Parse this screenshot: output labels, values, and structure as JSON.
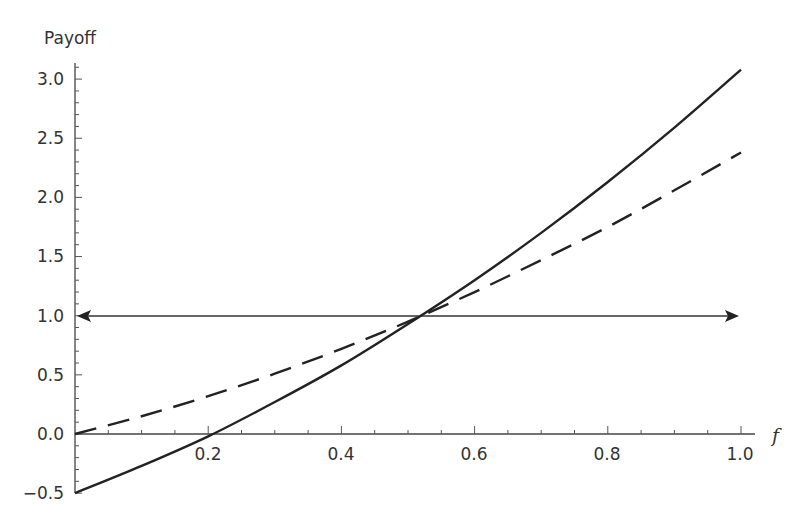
{
  "chart_data": {
    "type": "line",
    "title": "",
    "xlabel": "f",
    "ylabel": "Payoff",
    "xlim": [
      0,
      1.0
    ],
    "ylim": [
      -0.5,
      3.1
    ],
    "grid": false,
    "legend": null,
    "x_ticks": [
      "0.2",
      "0.4",
      "0.6",
      "0.8",
      "1.0"
    ],
    "y_ticks": [
      "-0.5",
      "0.0",
      "0.5",
      "1.0",
      "1.5",
      "2.0",
      "2.5",
      "3.0"
    ],
    "x": [
      0.0,
      0.1,
      0.2,
      0.3,
      0.4,
      0.5,
      0.6,
      0.7,
      0.8,
      0.9,
      1.0
    ],
    "series": [
      {
        "name": "solid",
        "style": "solid",
        "values": [
          -0.5,
          -0.27,
          -0.02,
          0.27,
          0.58,
          0.93,
          1.3,
          1.7,
          2.13,
          2.59,
          3.08
        ]
      },
      {
        "name": "dashed",
        "style": "dashed",
        "values": [
          0.0,
          0.15,
          0.32,
          0.51,
          0.72,
          0.95,
          1.2,
          1.47,
          1.75,
          2.06,
          2.38
        ]
      },
      {
        "name": "reference",
        "style": "double-arrow",
        "values": [
          1.0,
          1.0,
          1.0,
          1.0,
          1.0,
          1.0,
          1.0,
          1.0,
          1.0,
          1.0,
          1.0
        ]
      }
    ],
    "annotations": [
      "Horizontal double-headed arrow at Payoff = 1.0",
      "Curves intersect near f ≈ 0.52, Payoff = 1.0"
    ]
  },
  "labels": {
    "y_axis": "Payoff",
    "x_axis": "f",
    "y_ticks": [
      "3.0",
      "2.5",
      "2.0",
      "1.5",
      "1.0",
      "0.5",
      "0.0",
      "−0.5"
    ],
    "x_ticks": [
      "0.2",
      "0.4",
      "0.6",
      "0.8",
      "1.0"
    ]
  }
}
